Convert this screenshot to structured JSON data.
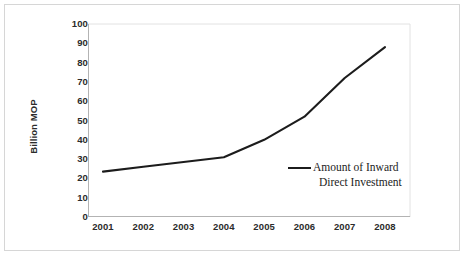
{
  "figure": {
    "background_color": "#ffffff",
    "frame_color": "#d6d6d6",
    "axis_color": "#b3b3b3",
    "line_color": "#1c1c1c"
  },
  "chart_data": {
    "type": "line",
    "title": "",
    "xlabel": "",
    "ylabel": "Billion MOP",
    "categories": [
      "2001",
      "2002",
      "2003",
      "2004",
      "2005",
      "2006",
      "2007",
      "2008"
    ],
    "x": [
      2001,
      2002,
      2003,
      2004,
      2005,
      2006,
      2007,
      2008
    ],
    "series": [
      {
        "name": "Amount of Inward Direct Investment",
        "values": [
          23.5,
          26,
          28.5,
          31,
          40,
          52,
          72,
          88
        ]
      }
    ],
    "values": [
      23.5,
      26,
      28.5,
      31,
      40,
      52,
      72,
      88
    ],
    "ylim": [
      0,
      100
    ],
    "yticks": [
      0,
      10,
      20,
      30,
      40,
      50,
      60,
      70,
      80,
      90,
      100
    ],
    "ytick_labels": [
      "0",
      "10",
      "20",
      "30",
      "40",
      "50",
      "60",
      "70",
      "80",
      "90",
      "100"
    ],
    "grid": false,
    "legend_position": "inside-center-right",
    "legend_entries": [
      "Amount of Inward Direct Investment"
    ]
  },
  "legend": {
    "line1": "Amount of Inward",
    "line2": "Direct Investment"
  }
}
